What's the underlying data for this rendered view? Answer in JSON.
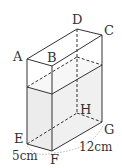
{
  "diagram": {
    "type": "rectangular-prism-with-water",
    "vertices": {
      "A": "A",
      "B": "B",
      "C": "C",
      "D": "D",
      "E": "E",
      "F": "F",
      "G": "G",
      "H": "H"
    },
    "dimensions": {
      "EF": "5cm",
      "FG": "12cm"
    },
    "colors": {
      "edge": "#333333",
      "water_fill": "#ebebeb"
    }
  }
}
